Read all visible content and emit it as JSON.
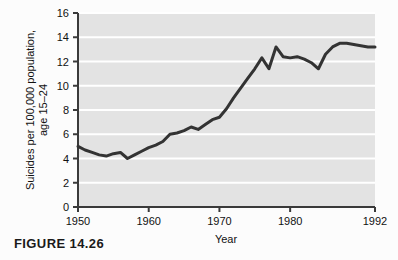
{
  "figure": {
    "caption": "FIGURE 14.26"
  },
  "chart_data": {
    "type": "line",
    "title": "",
    "xlabel": "Year",
    "ylabel": "Suicides per 100,000 population, age 15–24",
    "ylabel_line1": "Suicides per 100,000 population,",
    "ylabel_line2": "age 15–24",
    "xlim": [
      1950,
      1992
    ],
    "ylim": [
      0,
      16
    ],
    "xticks": [
      1950,
      1960,
      1970,
      1980,
      1992
    ],
    "xtick_labels": [
      "1950",
      "1960",
      "1970",
      "1980",
      "1992"
    ],
    "yticks": [
      0,
      2,
      4,
      6,
      8,
      10,
      12,
      14,
      16
    ],
    "ytick_labels": [
      "0",
      "2",
      "4",
      "6",
      "8",
      "10",
      "12",
      "14",
      "16"
    ],
    "grid": "horizontal-white",
    "legend": "none",
    "plot_background": "#e3e3e3",
    "gridline_color": "#ffffff",
    "line_color": "#333333",
    "line_width": 3,
    "x": [
      1950,
      1951,
      1952,
      1953,
      1954,
      1955,
      1956,
      1957,
      1958,
      1959,
      1960,
      1961,
      1962,
      1963,
      1964,
      1965,
      1966,
      1967,
      1968,
      1969,
      1970,
      1971,
      1972,
      1973,
      1974,
      1975,
      1976,
      1977,
      1978,
      1979,
      1980,
      1981,
      1982,
      1983,
      1984,
      1985,
      1986,
      1987,
      1988,
      1989,
      1990,
      1991,
      1992
    ],
    "values": [
      5.0,
      4.7,
      4.5,
      4.3,
      4.2,
      4.4,
      4.5,
      4.0,
      4.3,
      4.6,
      4.9,
      5.1,
      5.4,
      6.0,
      6.1,
      6.3,
      6.6,
      6.4,
      6.8,
      7.2,
      7.4,
      8.1,
      9.0,
      9.8,
      10.6,
      11.4,
      12.3,
      11.4,
      13.2,
      12.4,
      12.3,
      12.4,
      12.2,
      11.9,
      11.4,
      12.6,
      13.2,
      13.5,
      13.5,
      13.4,
      13.3,
      13.2,
      13.2
    ]
  }
}
